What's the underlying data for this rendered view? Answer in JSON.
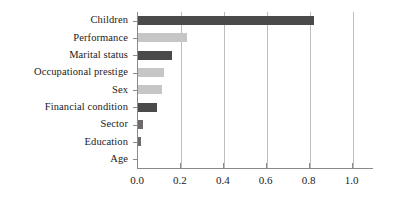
{
  "chart_data": {
    "type": "bar",
    "orientation": "horizontal",
    "title": "",
    "subtitle": "",
    "xlabel": "",
    "ylabel": "",
    "categories": [
      "Children",
      "Performance",
      "Marital status",
      "Occupational prestige",
      "Sex",
      "Financial condition",
      "Sector",
      "Education",
      "Age"
    ],
    "values": [
      0.82,
      0.23,
      0.16,
      0.12,
      0.11,
      0.09,
      0.025,
      0.012,
      0.0
    ],
    "bar_colors": [
      "#4a4a4a",
      "#c6c6c6",
      "#4a4a4a",
      "#c6c6c6",
      "#c6c6c6",
      "#4a4a4a",
      "#6b6b6b",
      "#6b6b6b",
      "#6b6b6b"
    ],
    "xlim": [
      0.0,
      1.1
    ],
    "xticks": [
      0.0,
      0.2,
      0.4,
      0.6,
      0.8,
      1.0
    ],
    "xtick_labels": [
      "0.0",
      "0.2",
      "0.4",
      "0.6",
      "0.8",
      "1.0"
    ],
    "grid": true,
    "grid_axis": "x",
    "grid_color": "#bdbdbd",
    "legend": null,
    "axis_color": "#8a8a8a"
  }
}
